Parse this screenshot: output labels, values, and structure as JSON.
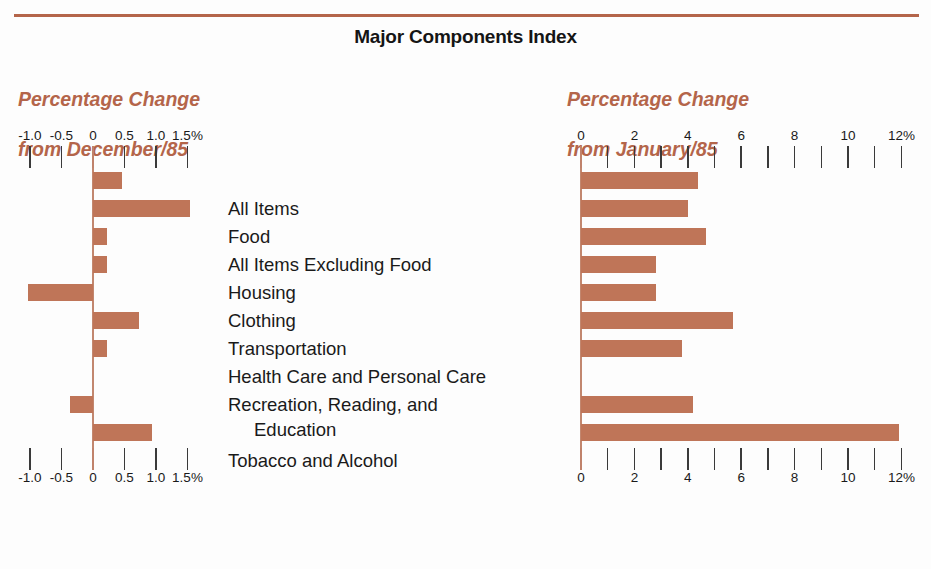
{
  "document": {
    "title": "Major Components Index",
    "rule_color": "#b4654a",
    "bar_color": "#bf7558",
    "accent_color": "#b4654a"
  },
  "panels": {
    "left": {
      "caption_line1": "Percentage Change",
      "caption_line2": "from December/85"
    },
    "right": {
      "caption_line1": "Percentage Change",
      "caption_line2": "from January/85"
    }
  },
  "categories": [
    "All Items",
    "Food",
    "All Items Excluding Food",
    "Housing",
    "Clothing",
    "Transportation",
    "Health Care and Personal Care",
    "Recreation, Reading, and",
    "Education",
    "Tobacco and Alcohol"
  ],
  "chart_data": [
    {
      "type": "bar",
      "orientation": "horizontal",
      "title": "Major Components Index",
      "subtitle": "Percentage Change from December/85",
      "xlabel": "",
      "ylabel": "",
      "xlim": [
        -1.25,
        1.75
      ],
      "grid": false,
      "legend": null,
      "axis_position": "both",
      "tick_values": [
        -1.0,
        -0.5,
        0,
        0.5,
        1.0,
        1.5
      ],
      "tick_labels": [
        "-1.0",
        "-0.5",
        "0",
        "0.5",
        "1.0",
        "1.5%"
      ],
      "categories": [
        "All Items",
        "Food",
        "All Items Excluding Food",
        "Housing",
        "Clothing",
        "Transportation",
        "Health Care and Personal Care",
        "Recreation, Reading, and Education",
        "Tobacco and Alcohol"
      ],
      "values": [
        0.46,
        1.54,
        0.22,
        0.22,
        -1.03,
        0.73,
        0.22,
        -0.37,
        0.94
      ]
    },
    {
      "type": "bar",
      "orientation": "horizontal",
      "title": "Major Components Index",
      "subtitle": "Percentage Change from January/85",
      "xlabel": "",
      "ylabel": "",
      "xlim": [
        0,
        12.6
      ],
      "grid": false,
      "legend": null,
      "axis_position": "both",
      "tick_values": [
        0,
        1,
        2,
        3,
        4,
        5,
        6,
        7,
        8,
        9,
        10,
        11,
        12
      ],
      "tick_labels": [
        "0",
        "",
        "2",
        "",
        "4",
        "",
        "6",
        "",
        "8",
        "",
        "10",
        "",
        "12%"
      ],
      "categories": [
        "All Items",
        "Food",
        "All Items Excluding Food",
        "Housing",
        "Clothing",
        "Transportation",
        "Health Care and Personal Care",
        "Recreation, Reading, and Education",
        "Tobacco and Alcohol"
      ],
      "values": [
        4.4,
        4.0,
        4.7,
        2.8,
        2.8,
        5.7,
        3.8,
        4.2,
        11.9
      ]
    }
  ]
}
